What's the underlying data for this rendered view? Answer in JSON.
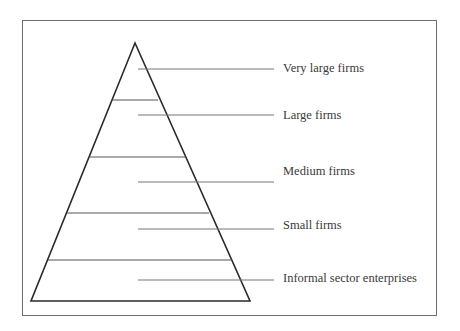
{
  "diagram": {
    "type": "pyramid",
    "levels": [
      {
        "label": "Very large firms",
        "order": 1
      },
      {
        "label": "Large firms",
        "order": 2
      },
      {
        "label": "Medium firms",
        "order": 3
      },
      {
        "label": "Small firms",
        "order": 4
      },
      {
        "label": "Informal sector enterprises",
        "order": 5
      }
    ],
    "orientation": "apex at top (fewest/largest firms), base at bottom (most numerous/informal)"
  }
}
